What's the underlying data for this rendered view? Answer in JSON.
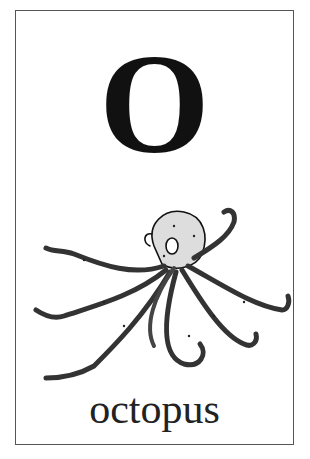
{
  "card": {
    "letter": "O",
    "word": "octopus",
    "illustration": "octopus-drawing",
    "border_color": "#555555"
  }
}
